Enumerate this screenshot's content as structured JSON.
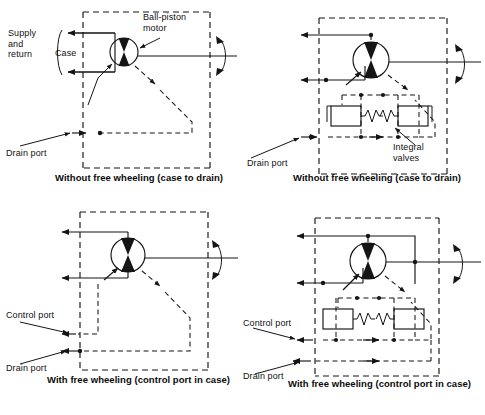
{
  "figure": {
    "line_color": "#151515",
    "background": "#ffffff"
  },
  "panels": [
    {
      "id": "top-left",
      "caption": "Without free wheeling (case to drain)",
      "labels": {
        "supply_and_return": "Supply\nand\nreturn",
        "case": "Case",
        "ball_piston_motor": "Ball-piston\nmotor",
        "drain_port": "Drain port"
      },
      "components": {
        "motor": "ball-piston-motor-symbol",
        "shaft": "rotating-shaft",
        "enclosure": "dashed-case-boundary"
      }
    },
    {
      "id": "top-right",
      "caption": "Without free wheeling (case to drain)",
      "labels": {
        "drain_port": "Drain port",
        "integral_valves": "Integral\nvalves"
      },
      "components": {
        "motor": "ball-piston-motor-symbol",
        "shaft": "rotating-shaft",
        "enclosure": "dashed-case-boundary",
        "valve_left": "spring-loaded-check-valve",
        "valve_right": "spring-loaded-check-valve"
      }
    },
    {
      "id": "bottom-left",
      "caption": "With free wheeling (control port in case)",
      "labels": {
        "control_port": "Control port",
        "drain_port": "Drain port"
      },
      "components": {
        "motor": "ball-piston-motor-symbol",
        "shaft": "rotating-shaft",
        "enclosure": "dashed-case-boundary"
      }
    },
    {
      "id": "bottom-right",
      "caption": "With free wheeling (control port in case)",
      "labels": {
        "control_port": "Control port",
        "drain_port": "Drain port"
      },
      "components": {
        "motor": "ball-piston-motor-symbol",
        "shaft": "rotating-shaft",
        "enclosure": "dashed-case-boundary",
        "valve_left": "spring-loaded-check-valve",
        "valve_right": "spring-loaded-check-valve"
      }
    }
  ]
}
